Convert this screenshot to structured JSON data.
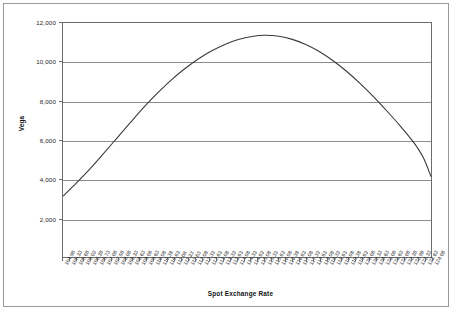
{
  "chart_data": {
    "type": "line",
    "title": "",
    "xlabel": "Spot Exchange Rate",
    "ylabel": "Vega",
    "ylim": [
      0,
      12000
    ],
    "ytick_values": [
      2000,
      4000,
      6000,
      8000,
      10000,
      12000
    ],
    "ytick_labels": [
      "2,000",
      "4,000",
      "6,000",
      "8,000",
      "10,000",
      "12,000"
    ],
    "grid": true,
    "grid_axis": "y",
    "legend": false,
    "legend_position": "none",
    "xlim": [
      104.98,
      124.08
    ],
    "xtick_labels": [
      "104.98",
      "105.33",
      "105.68",
      "106.03",
      "106.38",
      "106.73",
      "107.08",
      "107.58",
      "108.08",
      "108.33",
      "108.63",
      "109.08",
      "109.63",
      "110.08",
      "110.38",
      "110.63",
      "111.08",
      "111.33",
      "111.63",
      "112.08",
      "112.33",
      "112.63",
      "113.08",
      "113.33",
      "113.63",
      "114.08",
      "114.33",
      "114.63",
      "115.08",
      "115.33",
      "115.63",
      "116.08",
      "116.38",
      "116.63",
      "117.08",
      "117.33",
      "117.63",
      "118.08",
      "118.33",
      "118.63",
      "119.08",
      "119.38",
      "119.63",
      "120.08",
      "120.33",
      "120.63",
      "121.08",
      "121.63",
      "122.08",
      "122.38",
      "122.98",
      "123.33",
      "123.63",
      "124.08"
    ],
    "series": [
      {
        "name": "Vega",
        "x": [
          104.98,
          105.68,
          106.38,
          107.08,
          107.78,
          108.48,
          109.18,
          109.88,
          110.58,
          111.28,
          111.98,
          112.68,
          113.38,
          114.08,
          114.78,
          115.48,
          116.18,
          116.88,
          117.58,
          118.28,
          118.98,
          119.68,
          120.38,
          121.08,
          121.78,
          122.48,
          123.18,
          123.68,
          124.08
        ],
        "values": [
          3120,
          3800,
          4520,
          5300,
          6100,
          6900,
          7680,
          8400,
          9060,
          9640,
          10140,
          10560,
          10900,
          11150,
          11310,
          11370,
          11320,
          11160,
          10900,
          10540,
          10080,
          9540,
          8920,
          8240,
          7500,
          6720,
          5880,
          5100,
          4120
        ]
      }
    ]
  },
  "axes": {
    "y_title": "Vega",
    "x_title": "Spot Exchange Rate"
  },
  "style": {
    "line_color": "#3a3a3a",
    "grid_color": "#8d8d8d",
    "frame_color": "#6b6b6b",
    "background": "#ffffff"
  }
}
